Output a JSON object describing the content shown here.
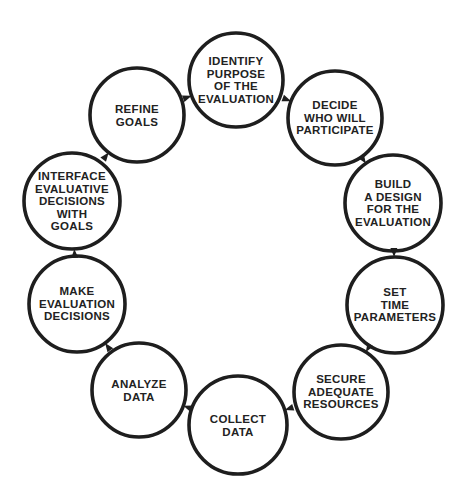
{
  "diagram": {
    "type": "cycle",
    "direction": "clockwise",
    "stroke_color": "#1e1e1e",
    "text_color": "#222222",
    "background": "#ffffff",
    "nodes": [
      {
        "id": "identify",
        "lines": [
          "IDENTIFY",
          "PURPOSE",
          "OF THE",
          "EVALUATION"
        ],
        "cx": 236,
        "cy": 80,
        "r": 47
      },
      {
        "id": "decide",
        "lines": [
          "DECIDE",
          "WHO WILL",
          "PARTICIPATE"
        ],
        "cx": 335,
        "cy": 118,
        "r": 47
      },
      {
        "id": "build",
        "lines": [
          "BUILD",
          "A DESIGN",
          "FOR THE",
          "EVALUATION"
        ],
        "cx": 393,
        "cy": 203,
        "r": 48
      },
      {
        "id": "set-time",
        "lines": [
          "SET",
          "TIME",
          "PARAMETERS"
        ],
        "cx": 395,
        "cy": 305,
        "r": 48
      },
      {
        "id": "secure",
        "lines": [
          "SECURE",
          "ADEQUATE",
          "RESOURCES"
        ],
        "cx": 341,
        "cy": 392,
        "r": 47
      },
      {
        "id": "collect",
        "lines": [
          "COLLECT",
          "DATA"
        ],
        "cx": 238,
        "cy": 425,
        "r": 49
      },
      {
        "id": "analyze",
        "lines": [
          "ANALYZE",
          "DATA"
        ],
        "cx": 139,
        "cy": 390,
        "r": 47
      },
      {
        "id": "make",
        "lines": [
          "MAKE",
          "EVALUATION",
          "DECISIONS"
        ],
        "cx": 77,
        "cy": 304,
        "r": 48
      },
      {
        "id": "interface",
        "lines": [
          "INTERFACE",
          "EVALUATIVE",
          "DECISIONS",
          "WITH",
          "GOALS"
        ],
        "cx": 72,
        "cy": 201,
        "r": 48
      },
      {
        "id": "refine",
        "lines": [
          "REFINE",
          "GOALS"
        ],
        "cx": 137,
        "cy": 115,
        "r": 47
      }
    ]
  }
}
